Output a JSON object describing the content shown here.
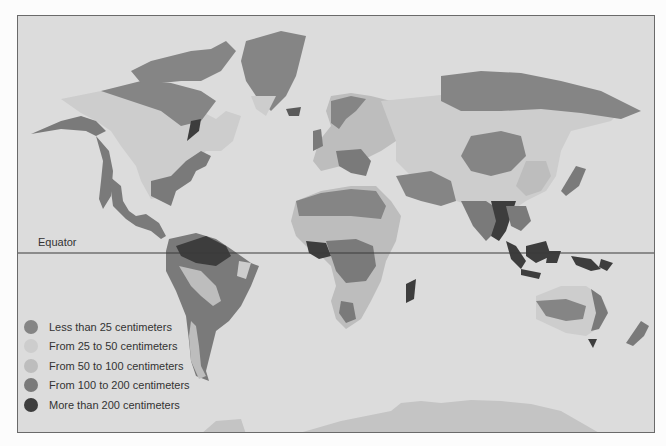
{
  "map": {
    "equator_label": "Equator",
    "background_color": "#dcdcdc",
    "legend": [
      {
        "label": "Less than 25 centimeters",
        "color": "#858585"
      },
      {
        "label": "From 25 to 50 centimeters",
        "color": "#cdcdcd"
      },
      {
        "label": "From 50 to 100 centimeters",
        "color": "#bdbdbd"
      },
      {
        "label": "From 100 to 200 centimeters",
        "color": "#7a7a7a"
      },
      {
        "label": "More than 200 centimeters",
        "color": "#3d3d3d"
      }
    ]
  }
}
